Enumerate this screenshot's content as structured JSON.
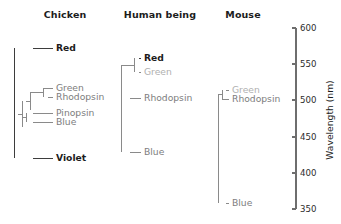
{
  "figure": {
    "type": "diagram",
    "subtype": "phylogenetic-dendrogram"
  },
  "panels": [
    {
      "id": "chicken",
      "title": "Chicken",
      "title_x": 65,
      "title_y": 18,
      "root_x": 14,
      "leaves": [
        {
          "name": "Red",
          "label": "Red",
          "y": 48,
          "wavelength": 571,
          "x_start": 33,
          "label_x": 56,
          "tone": "dark"
        },
        {
          "name": "Green",
          "label": "Green",
          "y": 88,
          "wavelength": 516,
          "x_start": 43,
          "label_x": 56,
          "tone": "gray"
        },
        {
          "name": "Rhodopsin",
          "label": "Rhodopsin",
          "y": 97,
          "wavelength": 503,
          "x_start": 48,
          "label_x": 56,
          "tone": "gray"
        },
        {
          "name": "Pinopsin",
          "label": "Pinopsin",
          "y": 113,
          "wavelength": 481,
          "x_start": 33,
          "label_x": 56,
          "tone": "gray"
        },
        {
          "name": "Blue",
          "label": "Blue",
          "y": 122,
          "wavelength": 468,
          "x_start": 33,
          "label_x": 56,
          "tone": "gray"
        },
        {
          "name": "Violet",
          "label": "Violet",
          "y": 158,
          "wavelength": 419,
          "x_start": 33,
          "label_x": 56,
          "tone": "dark"
        }
      ],
      "nodes": [
        {
          "id": "green-rhodopsin",
          "x": 43,
          "y_top": 88,
          "y_bot": 97,
          "join_x": 30,
          "join_y": 92.5,
          "tone": "gray"
        },
        {
          "id": "pinopsin-blue",
          "x": 26,
          "y_top": 113,
          "y_bot": 122,
          "join_x": 22,
          "join_y": 117.5,
          "tone": "gray"
        },
        {
          "id": "inner-clade",
          "x": 30,
          "y_top": 92.5,
          "y_bot": 110,
          "join_x": 26,
          "join_y": 101,
          "tone": "gray"
        },
        {
          "id": "mid-clade",
          "x": 22,
          "y_top": 101,
          "y_bot": 127,
          "join_x": 18,
          "join_y": 114,
          "tone": "gray"
        },
        {
          "id": "root",
          "x": 14,
          "y_top": 48,
          "y_bot": 158,
          "join_x": 14,
          "join_y": 103,
          "tone": "dark"
        }
      ]
    },
    {
      "id": "human",
      "title": "Human being",
      "title_x": 160,
      "title_y": 18,
      "root_x": 121,
      "leaves": [
        {
          "name": "Red",
          "label": "Red",
          "y": 58,
          "wavelength": 558,
          "x_start": 139,
          "label_x": 144,
          "tone": "dark"
        },
        {
          "name": "Green",
          "label": "Green",
          "y": 72,
          "wavelength": 539,
          "x_start": 139,
          "label_x": 144,
          "tone": "faint"
        },
        {
          "name": "Rhodopsin",
          "label": "Rhodopsin",
          "y": 98,
          "wavelength": 502,
          "x_start": 130,
          "label_x": 144,
          "tone": "gray"
        },
        {
          "name": "Blue",
          "label": "Blue",
          "y": 152,
          "wavelength": 427,
          "x_start": 130,
          "label_x": 144,
          "tone": "gray"
        }
      ],
      "nodes": [
        {
          "id": "red-green",
          "x": 134,
          "y_top": 58,
          "y_bot": 72,
          "join_x": 121,
          "join_y": 65,
          "tone": "gray"
        },
        {
          "id": "red-green-rhodopsin",
          "x": 121,
          "y_top": 65,
          "y_bot": 98,
          "join_x": 121,
          "join_y": 81,
          "tone": "gray"
        },
        {
          "id": "root",
          "x": 121,
          "y_top": 81,
          "y_bot": 152,
          "join_x": 121,
          "join_y": 116,
          "tone": "gray"
        }
      ]
    },
    {
      "id": "mouse",
      "title": "Mouse",
      "title_x": 243,
      "title_y": 18,
      "root_x": 218,
      "leaves": [
        {
          "name": "Green",
          "label": "Green",
          "y": 90,
          "wavelength": 510,
          "x_start": 226,
          "label_x": 232,
          "tone": "faint"
        },
        {
          "name": "Rhodopsin",
          "label": "Rhodopsin",
          "y": 99,
          "wavelength": 498,
          "x_start": 222,
          "label_x": 232,
          "tone": "gray"
        },
        {
          "name": "Blue",
          "label": "Blue",
          "y": 203,
          "wavelength": 359,
          "x_start": 226,
          "label_x": 232,
          "tone": "gray"
        }
      ],
      "nodes": [
        {
          "id": "green-rhodopsin",
          "x": 222,
          "y_top": 90,
          "y_bot": 99,
          "join_x": 218,
          "join_y": 94.5,
          "tone": "gray"
        },
        {
          "id": "root",
          "x": 218,
          "y_top": 94.5,
          "y_bot": 203,
          "join_x": 218,
          "join_y": 149,
          "tone": "gray"
        }
      ]
    }
  ],
  "axis": {
    "title": "Wavelength (nm)",
    "title_x": 333,
    "title_y": 120,
    "unit": "nm",
    "line_x": 296,
    "y_top": 28,
    "y_bottom": 209,
    "min": 350,
    "max": 600,
    "step": 50,
    "tick_length": 4,
    "ticks": [
      {
        "value": 600,
        "label": "600",
        "y": 28
      },
      {
        "value": 550,
        "label": "550",
        "y": 64
      },
      {
        "value": 500,
        "label": "500",
        "y": 100
      },
      {
        "value": 450,
        "label": "450",
        "y": 137
      },
      {
        "value": 400,
        "label": "400",
        "y": 173
      },
      {
        "value": 350,
        "label": "350",
        "y": 209
      }
    ]
  },
  "colors": {
    "background": "#ffffff",
    "text_dark": "#1c1c1c",
    "text_gray": "#7d7d7d",
    "text_faint": "#b0b0b0",
    "branch_gray": "#8a8a8a",
    "branch_dark": "#3d3d3d",
    "axis": "#6e6e6e"
  }
}
